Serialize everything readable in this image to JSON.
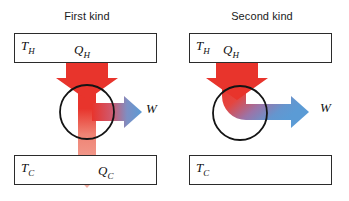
{
  "figure": {
    "background_color": "#ffffff",
    "panels": [
      {
        "id": "first-kind",
        "title": "First kind",
        "hot_reservoir_label_main": "T",
        "hot_reservoir_label_sub": "H",
        "cold_reservoir_label_main": "T",
        "cold_reservoir_label_sub": "C",
        "heat_in_label_main": "Q",
        "heat_in_label_sub": "H",
        "heat_out_label_main": "Q",
        "heat_out_label_sub": "C",
        "work_label": "W",
        "has_heat_rejection": true
      },
      {
        "id": "second-kind",
        "title": "Second kind",
        "hot_reservoir_label_main": "T",
        "hot_reservoir_label_sub": "H",
        "cold_reservoir_label_main": "T",
        "cold_reservoir_label_sub": "C",
        "heat_in_label_main": "Q",
        "heat_in_label_sub": "H",
        "work_label": "W",
        "has_heat_rejection": false
      }
    ]
  },
  "colors": {
    "heat_red_strong": "#e8342c",
    "heat_red_faded": "#f2ac9f",
    "work_blue": "#5b9bd5",
    "outline_black": "#2b2b2b",
    "text_black": "#111111"
  }
}
